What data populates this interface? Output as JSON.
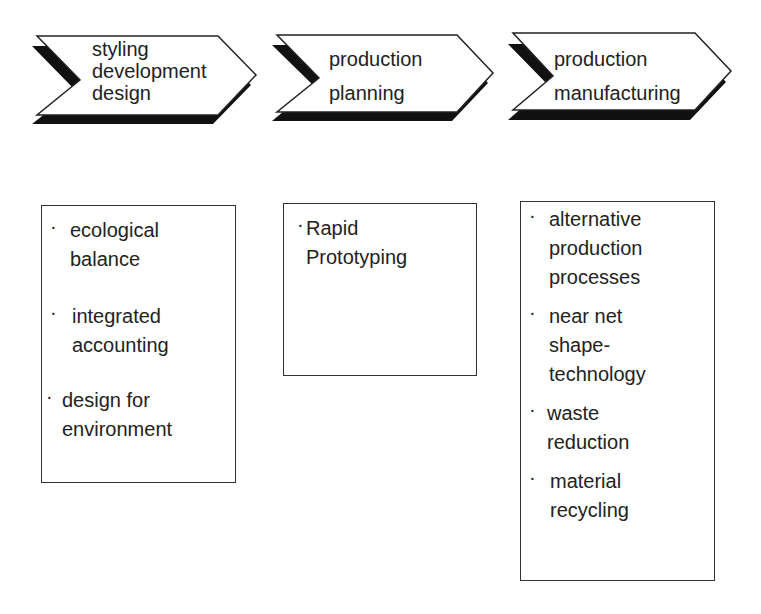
{
  "colors": {
    "stroke": "#222222",
    "shadow": "#111111",
    "fill": "#ffffff",
    "text": "#222222"
  },
  "stages": [
    {
      "label_lines": [
        "styling",
        "development",
        "design"
      ]
    },
    {
      "label_lines": [
        "production",
        "planning"
      ]
    },
    {
      "label_lines": [
        "production",
        "manufacturing"
      ]
    }
  ],
  "boxes": [
    {
      "items": [
        {
          "bullet": "·",
          "lines": [
            "ecological",
            "balance"
          ]
        },
        {
          "bullet": "·",
          "lines": [
            "integrated",
            "accounting"
          ]
        },
        {
          "bullet": "·",
          "lines": [
            "design for",
            "environment"
          ]
        }
      ]
    },
    {
      "items": [
        {
          "bullet": "·",
          "lines": [
            "Rapid",
            "Prototyping"
          ]
        }
      ]
    },
    {
      "items": [
        {
          "bullet": "·",
          "lines": [
            "alternative",
            "production",
            "processes"
          ]
        },
        {
          "bullet": "·",
          "lines": [
            "near net",
            "shape-",
            "technology"
          ]
        },
        {
          "bullet": "·",
          "lines": [
            "waste",
            "reduction"
          ]
        },
        {
          "bullet": "·",
          "lines": [
            "material",
            "recycling"
          ]
        }
      ]
    }
  ]
}
